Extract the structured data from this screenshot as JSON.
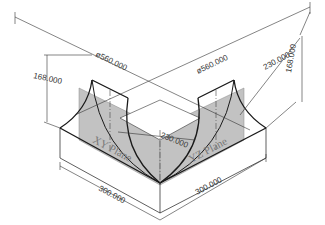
{
  "dimensions": {
    "diameter_left": "ø560.000",
    "diameter_right": "ø560.000",
    "height_left": "168.000",
    "height_right": "168.000",
    "radius_right": "230.000",
    "radius_center": "230.000",
    "width_left": "300.000",
    "width_right": "300.000"
  },
  "planes": {
    "xy": "XY Plane",
    "yz": "YZ Plane"
  },
  "colors": {
    "line": "#1a1a1a",
    "thin": "#333333",
    "plane_fill": "#bdbdbd",
    "background": "#ffffff"
  }
}
